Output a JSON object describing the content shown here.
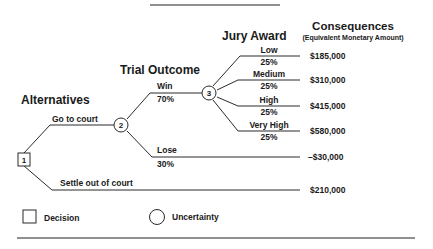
{
  "headers": {
    "alternatives": "Alternatives",
    "trial_outcome": "Trial Outcome",
    "jury_award": "Jury Award",
    "consequences": "Consequences",
    "consequences_sub": "(Equivalent Monetary Amount)"
  },
  "nodes": {
    "decision": "1",
    "trial": "2",
    "jury": "3"
  },
  "alternatives": [
    {
      "label": "Go to court"
    },
    {
      "label": "Settle out of court",
      "value": "$210,000"
    }
  ],
  "trial_outcomes": [
    {
      "label": "Win",
      "prob": "70%"
    },
    {
      "label": "Lose",
      "prob": "30%",
      "value": "–$30,000"
    }
  ],
  "jury_awards": [
    {
      "label": "Low",
      "prob": "25%",
      "value": "$185,000"
    },
    {
      "label": "Medium",
      "prob": "25%",
      "value": "$310,000"
    },
    {
      "label": "High",
      "prob": "25%",
      "value": "$415,000"
    },
    {
      "label": "Very High",
      "prob": "25%",
      "value": "$580,000"
    }
  ],
  "legend": {
    "decision": "Decision",
    "uncertainty": "Uncertainty"
  }
}
